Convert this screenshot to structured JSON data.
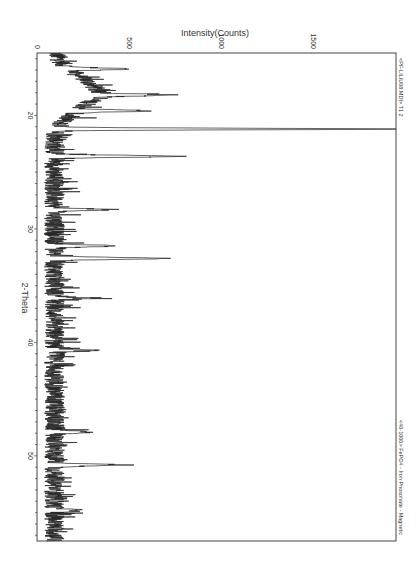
{
  "chart_data": {
    "type": "line",
    "title": "",
    "orientation": "rotated-90-clockwise",
    "xlabel": "2-Theta",
    "ylabel": "Intensity(Counts)",
    "xlim": [
      14.5,
      57.5
    ],
    "ylim": [
      0,
      1950
    ],
    "x_ticks": [
      20,
      30,
      40,
      50
    ],
    "y_ticks": [
      0,
      500,
      1000,
      1500
    ],
    "grid": false,
    "legend_top": "<PF-LILIU08.MDI> T1 2",
    "legend_bottom": "<40-1000> FePO4 - Iron Phosphate - Magnetic",
    "peaks": [
      {
        "two_theta": 15.9,
        "intensity": 330
      },
      {
        "two_theta": 18.2,
        "intensity": 420
      },
      {
        "two_theta": 19.6,
        "intensity": 380
      },
      {
        "two_theta": 21.2,
        "intensity": 1880
      },
      {
        "two_theta": 23.6,
        "intensity": 665
      },
      {
        "two_theta": 28.3,
        "intensity": 280
      },
      {
        "two_theta": 31.5,
        "intensity": 360
      },
      {
        "two_theta": 32.6,
        "intensity": 630
      },
      {
        "two_theta": 36.1,
        "intensity": 180
      },
      {
        "two_theta": 40.7,
        "intensity": 200
      },
      {
        "two_theta": 47.9,
        "intensity": 200
      },
      {
        "two_theta": 50.8,
        "intensity": 370
      },
      {
        "two_theta": 54.8,
        "intensity": 150
      }
    ],
    "background_hump": {
      "center": 18.0,
      "width": 2.0,
      "height": 230
    }
  },
  "axis": {
    "ylabel": "Intensity(Counts)",
    "xlabel": "2-Theta",
    "ytick_labels": [
      "0",
      "500",
      "1000",
      "1500"
    ],
    "xtick_labels": [
      "20",
      "30",
      "40",
      "50"
    ]
  },
  "legend": {
    "top": "<PF-LILIU08.MDI> T1 2",
    "bottom": "<40-1000> FePO4 - Iron Phosphate - Magnetic"
  }
}
